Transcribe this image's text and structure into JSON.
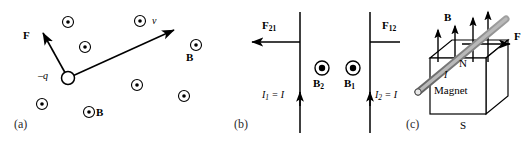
{
  "figure": {
    "width": 532,
    "height": 145,
    "background": "#ffffff",
    "ink": "#000000",
    "panel_label_color": "#2b2b2b",
    "rod_fill": "#a8a8a8",
    "rod_stroke": "#404040"
  },
  "panel_a": {
    "label": "(a)",
    "caption_pos": {
      "x": 14,
      "y": 124
    },
    "charge": {
      "name": "negative-charge",
      "label": "–q",
      "cx": 68,
      "cy": 78,
      "r": 6.5,
      "label_pos": {
        "x": 41,
        "y": 76
      }
    },
    "force_vector": {
      "label": "F",
      "from": {
        "x": 68,
        "y": 78
      },
      "to": {
        "x": 42,
        "y": 32
      },
      "label_pos": {
        "x": 25,
        "y": 36
      }
    },
    "velocity_vector": {
      "label": "v",
      "from": {
        "x": 68,
        "y": 78
      },
      "to": {
        "x": 176,
        "y": 29
      },
      "label_pos": {
        "x": 154,
        "y": 22
      }
    },
    "field_label": {
      "text": "B",
      "pos": {
        "x": 96,
        "y": 116
      }
    },
    "field_label_2": {
      "text": "B",
      "pos": {
        "x": 188,
        "y": 58
      }
    },
    "field_dots": [
      {
        "cx": 68,
        "cy": 22
      },
      {
        "cx": 140,
        "cy": 21
      },
      {
        "cx": 85,
        "cy": 47
      },
      {
        "cx": 137,
        "cy": 85
      },
      {
        "cx": 42,
        "cy": 104
      },
      {
        "cx": 89,
        "cy": 112
      },
      {
        "cx": 196,
        "cy": 45
      },
      {
        "cx": 184,
        "cy": 96
      }
    ],
    "dot_outer_r": 5.5,
    "dot_inner_r": 1.8
  },
  "panel_b": {
    "label": "(b)",
    "caption_pos": {
      "x": 22,
      "y": 124
    },
    "wire_1": {
      "name": "wire-left",
      "x": 88,
      "y_top": 12,
      "y_bottom": 133,
      "current_label": "I₁ = I",
      "current_label_text": "I",
      "current_sub": "1",
      "current_rest": " = I",
      "current_label_pos": {
        "x": 50,
        "y": 97
      },
      "current_arrow_y": 99,
      "field_label": "B",
      "field_sub": "2",
      "field_label_pos": {
        "x": 102,
        "y": 84
      },
      "field_dot": {
        "cx": 110,
        "cy": 68
      }
    },
    "force_1": {
      "label": "F",
      "sub": "21",
      "label_pos": {
        "x": 50,
        "y": 26
      },
      "from": {
        "x": 88,
        "y": 42
      },
      "to": {
        "x": 38,
        "y": 42
      }
    },
    "wire_2": {
      "name": "wire-right",
      "x": 158,
      "y_top": 12,
      "y_bottom": 133,
      "current_label_text": "I",
      "current_sub": "2",
      "current_rest": " = I",
      "current_label_pos": {
        "x": 163,
        "y": 97
      },
      "current_arrow_y": 99,
      "field_label": "B",
      "field_sub": "1",
      "field_label_pos": {
        "x": 133,
        "y": 84
      },
      "field_dot": {
        "cx": 141,
        "cy": 68
      }
    },
    "force_2": {
      "label": "F",
      "sub": "12",
      "label_pos": {
        "x": 172,
        "y": 26
      },
      "from": {
        "x": 158,
        "y": 42
      },
      "to": {
        "x": 208,
        "y": 42
      }
    },
    "dot_outer_r": 7,
    "dot_inner_r": 3.2
  },
  "panel_c": {
    "label": "(c)",
    "caption_pos": {
      "x": 8,
      "y": 124
    },
    "magnet": {
      "body_label": "Magnet",
      "body_label_pos": {
        "x": 34,
        "y": 92
      },
      "north_label": "N",
      "north_label_pos": {
        "x": 62,
        "y": 64
      },
      "south_label": "S",
      "south_label_pos": {
        "x": 62,
        "y": 126
      },
      "front_face": {
        "x": 30,
        "y": 58,
        "w": 56,
        "h": 56
      },
      "depth": {
        "dx": 22,
        "dy": -18
      }
    },
    "rod": {
      "name": "current-carrying-rod",
      "current_label": "I",
      "current_label_pos": {
        "x": 44,
        "y": 76
      },
      "from": {
        "x": 18,
        "y": 92
      },
      "to": {
        "x": 104,
        "y": 20
      }
    },
    "field_label": {
      "text": "B",
      "pos": {
        "x": 46,
        "y": 18
      }
    },
    "field_arrows": [
      {
        "x": 38,
        "y_bottom": 62,
        "y_top": 28
      },
      {
        "x": 55,
        "y_bottom": 62,
        "y_top": 24
      },
      {
        "x": 73,
        "y_bottom": 62,
        "y_top": 16
      },
      {
        "x": 88,
        "y_bottom": 62,
        "y_top": 10
      }
    ],
    "force_vector": {
      "label": "F",
      "from": {
        "x": 62,
        "y": 44
      },
      "to": {
        "x": 112,
        "y": 44
      },
      "label_pos": {
        "x": 116,
        "y": 36
      }
    }
  }
}
